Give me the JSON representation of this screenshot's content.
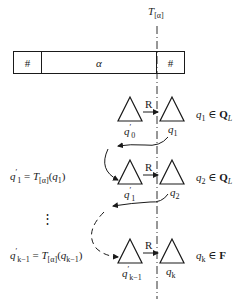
{
  "top_label": {
    "main": "T",
    "sub": "[α]"
  },
  "tape": {
    "left_cell": "#",
    "middle_cell": "α",
    "right_cell": "#"
  },
  "rows": [
    {
      "left_state": {
        "main": "q",
        "sup": "′",
        "sub": "0"
      },
      "right_state": {
        "main": "q",
        "sub": "1"
      },
      "relation": "R",
      "membership": {
        "var": "q",
        "sub": "1",
        "op": "∈",
        "set": "Q",
        "set_sub": "L"
      }
    },
    {
      "left_state": {
        "main": "q",
        "sup": "′",
        "sub": "1"
      },
      "right_state": {
        "main": "q",
        "sub": "2"
      },
      "relation": "R",
      "membership": {
        "var": "q",
        "sub": "2",
        "op": "∈",
        "set": "Q",
        "set_sub": "L"
      }
    },
    {
      "left_state": {
        "main": "q",
        "sup": "′",
        "sub": "k−1"
      },
      "right_state": {
        "main": "q",
        "sub": "k"
      },
      "relation": "R",
      "membership": {
        "var": "q",
        "sub": "k",
        "op": "∈",
        "set": "F",
        "set_sub": ""
      }
    }
  ],
  "equations": [
    {
      "lhs_main": "q",
      "lhs_sup": "′",
      "lhs_sub": "1",
      "eq": "=",
      "fn": "T",
      "fn_sub": "[α]",
      "arg_main": "q",
      "arg_sub": "1"
    },
    {
      "lhs_main": "q",
      "lhs_sup": "′",
      "lhs_sub": "k−1",
      "eq": "=",
      "fn": "T",
      "fn_sub": "[α]",
      "arg_main": "q",
      "arg_sub": "k−1"
    }
  ],
  "ellipsis": "⋮",
  "colors": {
    "ink": "#1a1a1a",
    "background": "#ffffff"
  }
}
